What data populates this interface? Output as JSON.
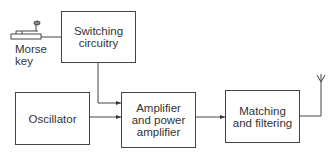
{
  "diagram": {
    "type": "block-diagram",
    "blocks": {
      "switching": "Switching circuitry",
      "oscillator": "Oscillator",
      "amplifier": "Amplifier and power amplifier",
      "matching": "Matching and filtering"
    },
    "labels": {
      "morse_key_line1": "Morse",
      "morse_key_line2": "key"
    },
    "block_lines": {
      "switching": [
        "Switching",
        "circuitry"
      ],
      "amplifier": [
        "Amplifier",
        "and power",
        "amplifier"
      ],
      "matching": [
        "Matching",
        "and filtering"
      ]
    },
    "connections": [
      {
        "from": "morse-key",
        "to": "switching"
      },
      {
        "from": "switching",
        "to": "amplifier"
      },
      {
        "from": "oscillator",
        "to": "amplifier"
      },
      {
        "from": "amplifier",
        "to": "matching"
      },
      {
        "from": "matching",
        "to": "antenna"
      }
    ]
  }
}
